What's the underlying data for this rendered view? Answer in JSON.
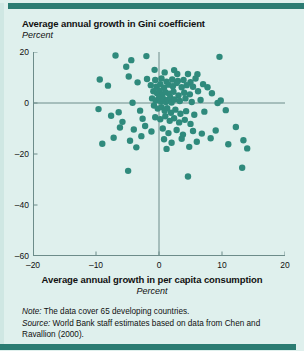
{
  "figure": {
    "title": "Average annual growth in Gini coefficient",
    "subtitle": "Percent",
    "xaxis_title": "Average annual growth in per capita consumption",
    "xaxis_subtitle": "Percent",
    "note_label": "Note:",
    "note_text": " The data cover 65 developing countries.",
    "source_label": "Source:",
    "source_text": " World Bank staff estimates based on data from Chen and Ravallion (2000)."
  },
  "colors": {
    "background": "#dff0ed",
    "band": "#2b7c72",
    "marker": "#2f8a7c",
    "axis": "#6d8c8a",
    "text": "#111111"
  },
  "chart_data": {
    "type": "scatter",
    "title": "Average annual growth in Gini coefficient",
    "xlabel": "Average annual growth in per capita consumption",
    "ylabel": "Average annual growth in Gini coefficient",
    "x_unit": "Percent",
    "y_unit": "Percent",
    "xlim": [
      -20,
      20
    ],
    "ylim": [
      -60,
      20
    ],
    "xticks": [
      -20,
      -10,
      0,
      10,
      20
    ],
    "xtick_labels": [
      "–20",
      "–10",
      "0",
      "10",
      "20"
    ],
    "yticks": [
      20,
      0,
      -20,
      -40,
      -60
    ],
    "ytick_labels": [
      "20",
      "0",
      "–20",
      "–40",
      "–60"
    ],
    "grid": false,
    "zero_lines": true,
    "legend": null,
    "n_points": 65,
    "marker_size": 3.2,
    "points": [
      [
        -6.9,
        18.6
      ],
      [
        -4.4,
        16.8
      ],
      [
        -2.0,
        18.4
      ],
      [
        9.6,
        18.1
      ],
      [
        -5.2,
        14.2
      ],
      [
        -0.7,
        13.0
      ],
      [
        0.9,
        12.0
      ],
      [
        2.4,
        12.9
      ],
      [
        -4.8,
        10.4
      ],
      [
        2.9,
        11.4
      ],
      [
        4.6,
        11.4
      ],
      [
        6.1,
        11.3
      ],
      [
        -9.4,
        9.2
      ],
      [
        -8.1,
        6.8
      ],
      [
        -3.4,
        8.1
      ],
      [
        -1.9,
        9.4
      ],
      [
        -0.6,
        9.0
      ],
      [
        0.4,
        9.6
      ],
      [
        1.2,
        8.4
      ],
      [
        2.1,
        9.2
      ],
      [
        3.0,
        8.6
      ],
      [
        3.9,
        9.0
      ],
      [
        5.0,
        8.2
      ],
      [
        5.8,
        9.6
      ],
      [
        -1.3,
        7.0
      ],
      [
        -0.4,
        6.4
      ],
      [
        0.2,
        7.4
      ],
      [
        0.8,
        6.0
      ],
      [
        1.5,
        7.2
      ],
      [
        2.2,
        6.6
      ],
      [
        2.8,
        7.8
      ],
      [
        3.6,
        6.2
      ],
      [
        4.4,
        7.0
      ],
      [
        5.4,
        6.4
      ],
      [
        7.0,
        7.4
      ],
      [
        7.7,
        6.2
      ],
      [
        -0.9,
        4.6
      ],
      [
        -0.3,
        3.8
      ],
      [
        0.1,
        4.8
      ],
      [
        0.5,
        3.2
      ],
      [
        1.0,
        4.2
      ],
      [
        1.6,
        3.6
      ],
      [
        2.3,
        4.4
      ],
      [
        3.1,
        3.0
      ],
      [
        4.0,
        4.0
      ],
      [
        4.9,
        3.4
      ],
      [
        6.2,
        4.6
      ],
      [
        8.4,
        3.8
      ],
      [
        -1.1,
        1.8
      ],
      [
        -0.5,
        1.0
      ],
      [
        0.0,
        2.0
      ],
      [
        0.3,
        0.6
      ],
      [
        0.7,
        1.6
      ],
      [
        1.1,
        0.4
      ],
      [
        1.4,
        1.2
      ],
      [
        1.8,
        2.2
      ],
      [
        2.0,
        0.2
      ],
      [
        2.5,
        1.4
      ],
      [
        3.3,
        0.8
      ],
      [
        4.2,
        1.8
      ],
      [
        5.2,
        0.4
      ],
      [
        6.6,
        1.2
      ],
      [
        9.3,
        0.0
      ],
      [
        9.8,
        1.0
      ],
      [
        -4.2,
        0.1
      ],
      [
        -9.6,
        -2.4
      ],
      [
        -6.4,
        -3.6
      ],
      [
        -3.0,
        -3.0
      ],
      [
        -0.8,
        -1.0
      ],
      [
        -0.2,
        -2.2
      ],
      [
        0.4,
        -1.6
      ],
      [
        0.9,
        -3.0
      ],
      [
        1.3,
        -2.0
      ],
      [
        1.9,
        -3.8
      ],
      [
        2.6,
        -2.6
      ],
      [
        3.4,
        -4.2
      ],
      [
        4.3,
        -3.2
      ],
      [
        5.6,
        -4.6
      ],
      [
        7.2,
        -3.4
      ],
      [
        10.6,
        -2.8
      ],
      [
        -0.6,
        -5.6
      ],
      [
        0.2,
        -6.4
      ],
      [
        1.0,
        -5.2
      ],
      [
        1.7,
        -7.0
      ],
      [
        2.4,
        -6.0
      ],
      [
        3.2,
        -7.6
      ],
      [
        4.1,
        -6.6
      ],
      [
        5.0,
        -8.2
      ],
      [
        -2.6,
        -6.2
      ],
      [
        -5.8,
        -7.4
      ],
      [
        -7.6,
        -5.0
      ],
      [
        -6.2,
        -9.6
      ],
      [
        -4.0,
        -10.4
      ],
      [
        -2.2,
        -9.0
      ],
      [
        -1.2,
        -11.2
      ],
      [
        0.6,
        -10.0
      ],
      [
        1.5,
        -11.8
      ],
      [
        2.8,
        -10.6
      ],
      [
        3.8,
        -12.4
      ],
      [
        5.4,
        -11.0
      ],
      [
        6.8,
        -12.0
      ],
      [
        9.0,
        -10.8
      ],
      [
        12.2,
        -9.4
      ],
      [
        -7.2,
        -13.6
      ],
      [
        -4.6,
        -14.8
      ],
      [
        -2.8,
        -13.0
      ],
      [
        0.8,
        -14.2
      ],
      [
        2.0,
        -15.6
      ],
      [
        3.6,
        -14.0
      ],
      [
        6.0,
        -15.2
      ],
      [
        8.2,
        -13.8
      ],
      [
        11.0,
        -16.2
      ],
      [
        -3.6,
        -17.4
      ],
      [
        1.2,
        -18.0
      ],
      [
        4.8,
        -17.2
      ],
      [
        -9.0,
        -16.0
      ],
      [
        13.4,
        -14.6
      ],
      [
        14.0,
        -17.8
      ],
      [
        -4.9,
        -26.6
      ],
      [
        4.6,
        -28.8
      ],
      [
        13.2,
        -25.4
      ]
    ]
  }
}
